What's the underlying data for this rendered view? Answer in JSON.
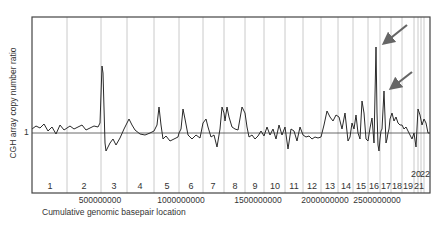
{
  "chart_data": {
    "type": "line",
    "title": "",
    "xlabel": "Cumulative genomic basepair location",
    "ylabel": "CGH array copy number ratio",
    "x_ticks": [
      "500000000",
      "1000000000",
      "1500000000",
      "2000000000",
      "2500000000"
    ],
    "y_ticks": [
      "1"
    ],
    "baseline": 1,
    "grid": false,
    "legend": null,
    "chromosomes": [
      "1",
      "2",
      "3",
      "4",
      "5",
      "6",
      "7",
      "8",
      "9",
      "10",
      "11",
      "12",
      "13",
      "14",
      "15",
      "16",
      "17",
      "18",
      "19",
      "20",
      "21",
      "22"
    ],
    "annotations": [
      {
        "type": "arrow",
        "target": "chromosome 17 high spike"
      },
      {
        "type": "arrow",
        "target": "chromosome 17/18 secondary spike"
      }
    ],
    "units_note": "Trace is approximate; y values are relative pixel heights above the ratio=1 baseline (positive = gain).",
    "series": [
      {
        "name": "copy number ratio",
        "x_px": [
          32,
          36,
          40,
          44,
          48,
          52,
          56,
          60,
          64,
          67,
          70,
          74,
          78,
          82,
          86,
          90,
          94,
          98,
          100,
          102,
          103,
          104,
          105,
          106,
          108,
          110,
          113,
          116,
          120,
          124,
          127,
          129,
          132,
          135,
          140,
          145,
          150,
          154,
          157,
          159,
          161,
          163,
          166,
          170,
          174,
          178,
          179,
          181,
          183,
          185,
          188,
          192,
          196,
          200,
          203,
          206,
          208,
          211,
          214,
          217,
          220,
          222,
          224,
          225,
          227,
          229,
          232,
          235,
          238,
          242,
          245,
          247,
          249,
          252,
          255,
          258,
          261,
          264,
          267,
          270,
          273,
          276,
          279,
          282,
          285,
          288,
          291,
          294,
          297,
          300,
          303,
          306,
          309,
          312,
          315,
          318,
          321,
          324,
          327,
          330,
          333,
          336,
          339,
          342,
          345,
          348,
          350,
          352,
          354,
          356,
          358,
          360,
          362,
          364,
          366,
          368,
          370,
          372,
          374,
          376,
          377,
          378,
          379,
          380,
          381,
          382,
          384,
          386,
          387,
          388,
          389,
          390,
          392,
          394,
          396,
          398,
          400,
          402,
          404,
          406,
          408,
          410,
          412,
          414,
          416,
          418,
          420,
          422,
          424,
          426,
          428,
          430
        ],
        "y_offset_px": [
          4,
          7,
          5,
          9,
          2,
          6,
          -1,
          8,
          3,
          5,
          7,
          4,
          6,
          8,
          3,
          5,
          7,
          6,
          10,
          67,
          60,
          25,
          -10,
          -18,
          -14,
          -10,
          -6,
          -12,
          -5,
          4,
          10,
          14,
          8,
          3,
          -1,
          -2,
          0,
          2,
          8,
          26,
          8,
          -6,
          -3,
          -8,
          -6,
          -4,
          0,
          4,
          24,
          14,
          -2,
          -6,
          -2,
          -5,
          10,
          14,
          6,
          -4,
          -2,
          -14,
          4,
          26,
          20,
          12,
          26,
          16,
          6,
          4,
          3,
          26,
          20,
          6,
          -4,
          -2,
          -6,
          -3,
          2,
          -3,
          6,
          -2,
          4,
          -6,
          8,
          -2,
          6,
          -16,
          4,
          2,
          -8,
          6,
          -2,
          -4,
          -3,
          -6,
          -4,
          -5,
          -4,
          8,
          22,
          16,
          12,
          18,
          16,
          4,
          20,
          -8,
          -4,
          10,
          4,
          18,
          0,
          -6,
          32,
          20,
          -6,
          -8,
          5,
          15,
          -10,
          86,
          20,
          -12,
          -18,
          -6,
          2,
          4,
          42,
          -10,
          -6,
          0,
          4,
          14,
          20,
          12,
          16,
          10,
          8,
          8,
          4,
          6,
          2,
          -2,
          -6,
          0,
          -14,
          24,
          18,
          8,
          14,
          10
        ]
      }
    ]
  },
  "figure": {
    "ylabel": "CGH array copy number ratio",
    "xlabel": "Cumulative genomic basepair location",
    "ytick_label": "1",
    "xticks": [
      {
        "label": "500000000",
        "x": 100
      },
      {
        "label": "1000000000",
        "x": 181
      },
      {
        "label": "1500000000",
        "x": 258
      },
      {
        "label": "2000000000",
        "x": 325
      },
      {
        "label": "2500000000",
        "x": 377
      }
    ],
    "chromosome_labels": [
      {
        "label": "1",
        "x": 50,
        "y": 181
      },
      {
        "label": "2",
        "x": 84,
        "y": 181
      },
      {
        "label": "3",
        "x": 114,
        "y": 181
      },
      {
        "label": "4",
        "x": 140,
        "y": 181
      },
      {
        "label": "5",
        "x": 167,
        "y": 181
      },
      {
        "label": "6",
        "x": 191,
        "y": 181
      },
      {
        "label": "7",
        "x": 213,
        "y": 181
      },
      {
        "label": "8",
        "x": 235,
        "y": 181
      },
      {
        "label": "9",
        "x": 255,
        "y": 181
      },
      {
        "label": "10",
        "x": 275,
        "y": 181
      },
      {
        "label": "11",
        "x": 294,
        "y": 181
      },
      {
        "label": "12",
        "x": 312,
        "y": 181
      },
      {
        "label": "13",
        "x": 330,
        "y": 181
      },
      {
        "label": "14",
        "x": 346,
        "y": 181
      },
      {
        "label": "15",
        "x": 361,
        "y": 181
      },
      {
        "label": "16",
        "x": 374,
        "y": 181
      },
      {
        "label": "17",
        "x": 386,
        "y": 181
      },
      {
        "label": "18",
        "x": 397,
        "y": 181
      },
      {
        "label": "19",
        "x": 408,
        "y": 181
      },
      {
        "label": "20",
        "x": 416,
        "y": 169
      },
      {
        "label": "21",
        "x": 419,
        "y": 181
      },
      {
        "label": "22",
        "x": 425,
        "y": 169
      }
    ],
    "dividers_x": [
      67,
      101,
      127,
      154,
      179,
      203,
      224,
      245,
      264,
      285,
      303,
      321,
      338,
      353,
      368,
      380,
      391,
      402,
      414,
      418,
      421,
      424
    ],
    "colors": {
      "trace": "#2a2a2a",
      "axis": "#444444",
      "divider": "#bdbdbd",
      "baseline": "#444444",
      "arrow": "#666666"
    }
  }
}
